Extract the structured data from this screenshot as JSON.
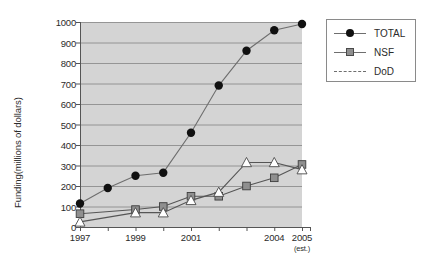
{
  "chart_data": {
    "type": "line",
    "title": "",
    "xlabel": "",
    "ylabel": "Funding(millions of dollars)",
    "x": [
      "1997",
      "1998",
      "1999",
      "2000",
      "2001",
      "2002",
      "2003",
      "2004",
      "2005"
    ],
    "categories": [
      "1997",
      "1998",
      "1999",
      "2000",
      "2001",
      "2002",
      "2003",
      "2004",
      "2005"
    ],
    "xtick_labels": [
      "1997",
      "1999",
      "2001",
      "2004",
      "2005"
    ],
    "xtick_sublabel_2005": "(est.)",
    "ylim": [
      0,
      1000
    ],
    "ytick_labels": [
      "0",
      "100",
      "200",
      "300",
      "400",
      "500",
      "600",
      "700",
      "800",
      "900",
      "1000"
    ],
    "ytick_values": [
      0,
      100,
      200,
      300,
      400,
      500,
      600,
      700,
      800,
      900,
      1000
    ],
    "grid": "horizontal",
    "legend_position": "right-outside",
    "plot_background": "#d4d4d4",
    "series": [
      {
        "name": "TOTAL",
        "marker": "filled-circle",
        "color": "#111111",
        "line_color": "#6e6e6e",
        "values": [
          115,
          190,
          250,
          265,
          460,
          690,
          860,
          960,
          990
        ]
      },
      {
        "name": "NSF",
        "marker": "filled-square",
        "color": "#8f8f8f",
        "line_color": "#555555",
        "values": [
          65,
          null,
          85,
          100,
          150,
          150,
          200,
          240,
          305
        ]
      },
      {
        "name": "DoD",
        "marker": "open-triangle",
        "color": "#ffffff",
        "line_color": "#555555",
        "values": [
          25,
          null,
          70,
          70,
          130,
          170,
          315,
          315,
          280
        ]
      }
    ]
  },
  "legend": {
    "items": [
      {
        "label": "TOTAL",
        "marker": "filled-circle",
        "style": "solid"
      },
      {
        "label": "NSF",
        "marker": "filled-square",
        "style": "solid"
      },
      {
        "label": "DoD",
        "marker": "none",
        "style": "dashed"
      }
    ]
  },
  "axes": {
    "y_title": "Funding(millions of dollars)"
  }
}
